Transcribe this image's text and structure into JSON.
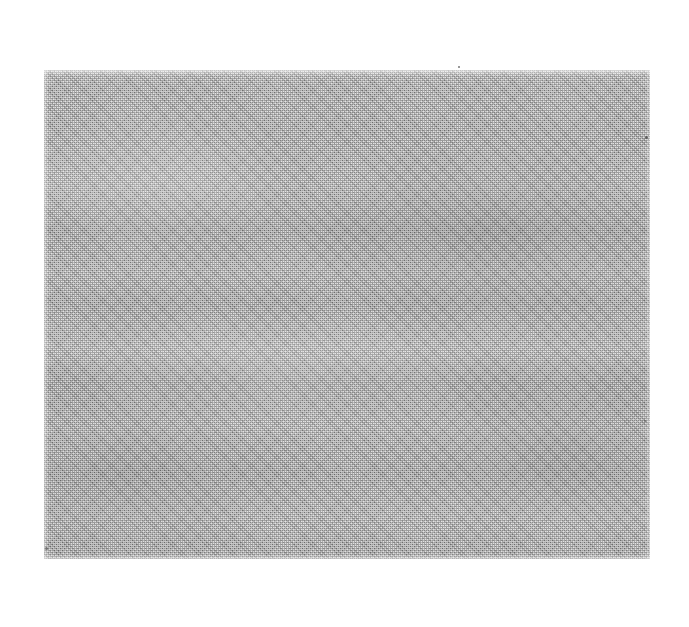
{
  "page": {
    "background_color": "#ffffff",
    "width": 689,
    "height": 627,
    "caption": "",
    "visible_text": ""
  },
  "plate": {
    "name": "scanned-gray-plate",
    "description": "Blank uniform halftone-screened gray rectangle on a white page",
    "content_text": "",
    "fill_color": "#b2b2b2",
    "base_tone": "#b4b4b4",
    "edge_color": "#ffffff",
    "bounds": {
      "left": 44,
      "top": 70,
      "width": 606,
      "height": 489,
      "right": 650,
      "bottom": 559
    },
    "texture": {
      "type": "halftone-dither",
      "screen_pitch_px": 2,
      "has_horizontal_banding": true,
      "has_mottling": true,
      "edges": "soft-feathered"
    }
  },
  "artifacts": {
    "label": "scan-specks",
    "count": 4,
    "color": "#4a4a4a",
    "items": [
      {
        "name": "speck-top-center",
        "x": 458,
        "y": 66,
        "size": 2
      },
      {
        "name": "speck-right-edge",
        "x": 645,
        "y": 136,
        "size": 3
      },
      {
        "name": "speck-right-low",
        "x": 644,
        "y": 420,
        "size": 2
      },
      {
        "name": "speck-left-low",
        "x": 45,
        "y": 547,
        "size": 3
      }
    ]
  }
}
